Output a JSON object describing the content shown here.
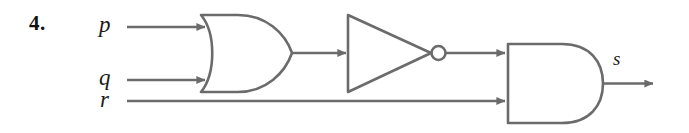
{
  "figure": {
    "item_number": "4.",
    "type": "logic-circuit-diagram",
    "line_color": "#6b6b6b",
    "text_color": "#1c1c1c",
    "background_color": "#ffffff"
  },
  "inputs": [
    {
      "id": "p",
      "label": "p",
      "target": "or-gate",
      "pin": "top"
    },
    {
      "id": "q",
      "label": "q",
      "target": "or-gate",
      "pin": "bottom"
    },
    {
      "id": "r",
      "label": "r",
      "target": "and-gate",
      "pin": "bottom"
    }
  ],
  "gates": [
    {
      "id": "or-gate",
      "name": "OR",
      "inputs": [
        "p",
        "q"
      ],
      "output": "or-out"
    },
    {
      "id": "not-gate",
      "name": "NOT",
      "inputs": [
        "or-out"
      ],
      "output": "not-out"
    },
    {
      "id": "and-gate",
      "name": "AND",
      "inputs": [
        "not-out",
        "r"
      ],
      "output": "s"
    }
  ],
  "outputs": [
    {
      "id": "s",
      "label": "s",
      "source": "and-gate"
    }
  ]
}
